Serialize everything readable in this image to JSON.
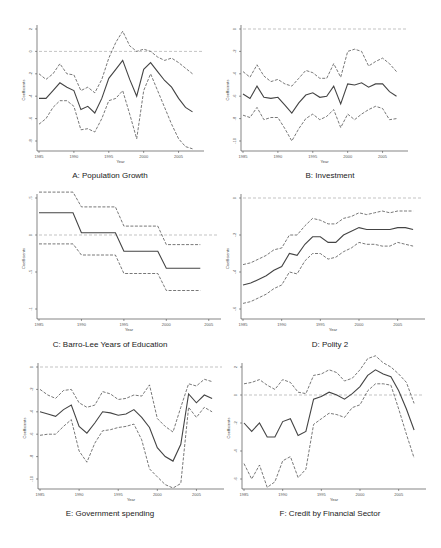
{
  "figure": {
    "panels_caption": [
      "A: Population Growth",
      "B: Investment",
      "C: Barro-Lee Years of Education",
      "D: Polity 2",
      "E: Government spending",
      "F: Credit by Financial Sector"
    ]
  },
  "chart_data": [
    {
      "type": "line",
      "title": "A: Population Growth",
      "xlabel": "Year",
      "ylabel": "Coefficients",
      "x": [
        1985,
        1986,
        1987,
        1988,
        1989,
        1990,
        1991,
        1992,
        1993,
        1994,
        1995,
        1996,
        1997,
        1998,
        1999,
        2000,
        2001,
        2002,
        2003,
        2004,
        2005,
        2006,
        2007
      ],
      "xticks": [
        1985,
        1990,
        1995,
        2000,
        2005
      ],
      "xlim": [
        1984.7,
        2007.5
      ],
      "yticks": [
        2,
        0,
        -2,
        -4,
        -6,
        -8
      ],
      "ytick_labels": [
        "2",
        "0",
        "-2",
        "-4",
        "-6",
        "-8"
      ],
      "ylim": [
        -8.8,
        2.2
      ],
      "zero_line": true,
      "series": [
        {
          "name": "upper CI",
          "style": "dashed",
          "values": [
            -2,
            -2.5,
            -2,
            -1.1,
            -2,
            -2.1,
            -3.5,
            -3.2,
            -3.7,
            -2.5,
            -0.6,
            0.8,
            1.8,
            0.5,
            0,
            0.2,
            0,
            -0.5,
            -0.8,
            -0.6,
            -1,
            -1.5,
            -2
          ]
        },
        {
          "name": "coefficient",
          "style": "solid",
          "values": [
            -4.2,
            -4.2,
            -3.5,
            -2.8,
            -3.2,
            -3.5,
            -5.2,
            -4.9,
            -5.5,
            -4.2,
            -2.4,
            -1.6,
            -0.8,
            -2.5,
            -4,
            -1.6,
            -1,
            -1.8,
            -2.6,
            -3.2,
            -4.2,
            -5,
            -5.4
          ]
        },
        {
          "name": "lower CI",
          "style": "dashed",
          "values": [
            -6.5,
            -6,
            -5,
            -4.4,
            -4.4,
            -4.9,
            -7,
            -6.9,
            -7.2,
            -6,
            -4.4,
            -4.2,
            -3.5,
            -5.6,
            -7.8,
            -3.5,
            -2,
            -3.5,
            -5,
            -6.5,
            -7.8,
            -8.5,
            -8.7
          ]
        }
      ]
    },
    {
      "type": "line",
      "title": "B: Investment",
      "xlabel": "Year",
      "ylabel": "Coefficients",
      "x": [
        1985,
        1986,
        1987,
        1988,
        1989,
        1990,
        1991,
        1992,
        1993,
        1994,
        1995,
        1996,
        1997,
        1998,
        1999,
        2000,
        2001,
        2002,
        2003,
        2004,
        2005,
        2006,
        2007
      ],
      "xticks": [
        1985,
        1990,
        1995,
        2000,
        2005
      ],
      "xlim": [
        1984.7,
        2007.5
      ],
      "yticks": [
        0,
        -2,
        -4,
        -6,
        -8,
        -10
      ],
      "ytick_labels": [
        "0",
        "-2",
        "-4",
        "-6",
        "-8",
        "-10"
      ],
      "ylim": [
        -10.3,
        0.2
      ],
      "zero_line": true,
      "series": [
        {
          "name": "upper CI",
          "style": "dashed",
          "values": [
            -3.8,
            -4.3,
            -3.2,
            -4.2,
            -4.7,
            -4.5,
            -4.9,
            -5.1,
            -4.4,
            -3.7,
            -3.9,
            -4.4,
            -4.4,
            -3.1,
            -4.3,
            -2,
            -1.8,
            -2,
            -3.3,
            -2.9,
            -2.6,
            -3.1,
            -3.8
          ]
        },
        {
          "name": "coefficient",
          "style": "solid",
          "values": [
            -5.8,
            -6.2,
            -5.1,
            -6.1,
            -6.2,
            -6.1,
            -6.8,
            -7.5,
            -6.6,
            -5.9,
            -5.7,
            -6.1,
            -6,
            -5.1,
            -6.7,
            -4.9,
            -5,
            -4.8,
            -5.2,
            -4.9,
            -4.9,
            -5.6,
            -6
          ]
        },
        {
          "name": "lower CI",
          "style": "dashed",
          "values": [
            -7.7,
            -7.9,
            -7,
            -8.1,
            -7.9,
            -7.9,
            -8.9,
            -10,
            -8.9,
            -8,
            -7.6,
            -8.1,
            -7.8,
            -7.2,
            -8.8,
            -7.6,
            -8.1,
            -7.6,
            -7.2,
            -6.9,
            -7.1,
            -8.1,
            -8
          ]
        }
      ]
    },
    {
      "type": "line",
      "title": "C: Barro-Lee Years of Education",
      "xlabel": "Year",
      "ylabel": "Coefficients",
      "x": [
        1985,
        1989,
        1990,
        1994,
        1995,
        1999,
        2000,
        2004
      ],
      "xticks": [
        1985,
        1990,
        1995,
        2000,
        2005
      ],
      "xlim": [
        1984.7,
        2005.5
      ],
      "yticks": [
        0.5,
        0,
        -0.5,
        -1
      ],
      "ytick_labels": [
        ".5",
        "0",
        "-.5",
        "-1"
      ],
      "ylim": [
        -1.05,
        0.6
      ],
      "zero_line": true,
      "series": [
        {
          "name": "upper CI",
          "style": "dashed",
          "values": [
            0.58,
            0.58,
            0.38,
            0.38,
            0.12,
            0.12,
            -0.13,
            -0.13
          ]
        },
        {
          "name": "coefficient",
          "style": "solid",
          "values": [
            0.3,
            0.3,
            0.03,
            0.03,
            -0.22,
            -0.22,
            -0.45,
            -0.45
          ]
        },
        {
          "name": "lower CI",
          "style": "dashed",
          "values": [
            -0.12,
            -0.12,
            -0.27,
            -0.27,
            -0.52,
            -0.52,
            -0.75,
            -0.75
          ]
        }
      ]
    },
    {
      "type": "line",
      "title": "D: Polity 2",
      "xlabel": "Year",
      "ylabel": "Coefficients",
      "x": [
        1985,
        1986,
        1987,
        1988,
        1989,
        1990,
        1991,
        1992,
        1993,
        1994,
        1995,
        1996,
        1997,
        1998,
        1999,
        2000,
        2001,
        2002,
        2003,
        2004,
        2005,
        2006,
        2007
      ],
      "xticks": [
        1985,
        1990,
        1995,
        2000,
        2005
      ],
      "xlim": [
        1984.7,
        2007.5
      ],
      "yticks": [
        0,
        -0.2,
        -0.4,
        -0.6
      ],
      "ytick_labels": [
        "0",
        "-.2",
        "-.4",
        "-.6"
      ],
      "ylim": [
        -0.62,
        0.02
      ],
      "zero_line": true,
      "series": [
        {
          "name": "upper CI",
          "style": "dashed",
          "values": [
            -0.36,
            -0.35,
            -0.33,
            -0.31,
            -0.28,
            -0.27,
            -0.2,
            -0.2,
            -0.15,
            -0.11,
            -0.12,
            -0.14,
            -0.14,
            -0.11,
            -0.1,
            -0.08,
            -0.09,
            -0.08,
            -0.07,
            -0.08,
            -0.07,
            -0.07,
            -0.07
          ]
        },
        {
          "name": "coefficient",
          "style": "solid",
          "values": [
            -0.47,
            -0.46,
            -0.44,
            -0.42,
            -0.39,
            -0.37,
            -0.3,
            -0.31,
            -0.25,
            -0.21,
            -0.21,
            -0.24,
            -0.24,
            -0.2,
            -0.18,
            -0.16,
            -0.17,
            -0.17,
            -0.17,
            -0.17,
            -0.16,
            -0.16,
            -0.17
          ]
        },
        {
          "name": "lower CI",
          "style": "dashed",
          "values": [
            -0.57,
            -0.56,
            -0.54,
            -0.52,
            -0.49,
            -0.47,
            -0.4,
            -0.41,
            -0.34,
            -0.3,
            -0.3,
            -0.33,
            -0.32,
            -0.29,
            -0.27,
            -0.24,
            -0.25,
            -0.25,
            -0.26,
            -0.26,
            -0.24,
            -0.25,
            -0.26
          ]
        }
      ]
    },
    {
      "type": "line",
      "title": "E: Government spending",
      "xlabel": "Year",
      "ylabel": "Coefficients",
      "x": [
        1985,
        1986,
        1987,
        1988,
        1989,
        1990,
        1991,
        1992,
        1993,
        1994,
        1995,
        1996,
        1997,
        1998,
        1999,
        2000,
        2001,
        2002,
        2003,
        2004,
        2005,
        2006,
        2007
      ],
      "xticks": [
        1985,
        1990,
        1995,
        2000,
        2005
      ],
      "xlim": [
        1984.7,
        2007.5
      ],
      "yticks": [
        0,
        -2,
        -4,
        -6,
        -8,
        -10
      ],
      "ytick_labels": [
        "0",
        "-2",
        "-4",
        "-6",
        "-8",
        "-10"
      ],
      "ylim": [
        -11,
        0.2
      ],
      "zero_line": true,
      "series": [
        {
          "name": "upper CI",
          "style": "dashed",
          "values": [
            -2,
            -2.5,
            -2.8,
            -2.1,
            -2,
            -3.2,
            -3.6,
            -3.4,
            -2.2,
            -2.4,
            -2.9,
            -2.8,
            -2.5,
            -2.6,
            -1.6,
            -4.6,
            -5.3,
            -5.8,
            -3.6,
            -1.5,
            -1.7,
            -1.1,
            -1.3
          ]
        },
        {
          "name": "coefficient",
          "style": "solid",
          "values": [
            -4,
            -4.2,
            -4.4,
            -3.8,
            -3.4,
            -5.3,
            -5.9,
            -5,
            -4,
            -4.1,
            -4.3,
            -4.2,
            -3.8,
            -4.5,
            -5.4,
            -7.2,
            -8,
            -8.4,
            -6.9,
            -2.4,
            -3.2,
            -2.5,
            -2.8
          ]
        },
        {
          "name": "lower CI",
          "style": "dashed",
          "values": [
            -6.1,
            -6,
            -6,
            -5.3,
            -4.7,
            -7.5,
            -8.5,
            -6.8,
            -5.7,
            -5.6,
            -5.4,
            -5.3,
            -5.1,
            -6.5,
            -9.1,
            -9.8,
            -10.5,
            -10.8,
            -10.4,
            -3.6,
            -4.5,
            -3.6,
            -4
          ]
        }
      ]
    },
    {
      "type": "line",
      "title": "F: Credit by Financial Sector",
      "xlabel": "Year",
      "ylabel": "Coefficients",
      "x": [
        1985,
        1986,
        1987,
        1988,
        1989,
        1990,
        1991,
        1992,
        1993,
        1994,
        1995,
        1996,
        1997,
        1998,
        1999,
        2000,
        2001,
        2002,
        2003,
        2004,
        2005,
        2006,
        2007
      ],
      "xticks": [
        1985,
        1990,
        1995,
        2000,
        2005
      ],
      "xlim": [
        1984.7,
        2007.5
      ],
      "yticks": [
        2,
        0,
        -2,
        -4,
        -6
      ],
      "ytick_labels": [
        "2",
        "0",
        "-2",
        "-4",
        "-6"
      ],
      "ylim": [
        -7,
        2.9
      ],
      "zero_line": true,
      "series": [
        {
          "name": "upper CI",
          "style": "dashed",
          "values": [
            0.8,
            0.9,
            1.1,
            0.7,
            0.4,
            1.1,
            0.9,
            0.2,
            0.1,
            1.4,
            1.5,
            1.8,
            1.6,
            1,
            1.2,
            1.8,
            2.6,
            2.8,
            2.3,
            2,
            1.5,
            0.9,
            -0.6
          ]
        },
        {
          "name": "coefficient",
          "style": "solid",
          "values": [
            -2,
            -2.6,
            -2,
            -3,
            -3,
            -1.9,
            -1.7,
            -2.9,
            -2.6,
            -0.3,
            -0.1,
            0.2,
            0,
            -0.3,
            0.1,
            0.6,
            1.4,
            1.8,
            1.5,
            1.3,
            0.3,
            -1,
            -2.5
          ]
        },
        {
          "name": "lower CI",
          "style": "dashed",
          "values": [
            -4.9,
            -6,
            -5,
            -6.6,
            -6.2,
            -4.7,
            -4.4,
            -5.9,
            -5.3,
            -2.1,
            -1.7,
            -1.3,
            -1.4,
            -1.6,
            -0.9,
            -0.7,
            0.3,
            0.8,
            0.8,
            0.7,
            -1,
            -2.8,
            -4.5
          ]
        }
      ]
    }
  ]
}
